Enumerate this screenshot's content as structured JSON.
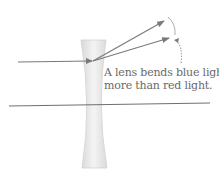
{
  "caption": {
    "line1": "A lens bends blue light",
    "line2": "more than red light."
  },
  "colors": {
    "ray": "#7a7a7a",
    "lens_fill": "#e6e6e6",
    "lens_edge": "#d0d0d0",
    "axis": "#6f6f6f",
    "text": "#6a6a6a"
  },
  "elements": {
    "lens": "concave-lens",
    "incident_ray": "incoming-light-ray",
    "refracted_rays": [
      "blue-ray",
      "red-ray"
    ],
    "indicator": "dotted-arc-arrow",
    "optical_axis": "horizontal-axis-line"
  }
}
